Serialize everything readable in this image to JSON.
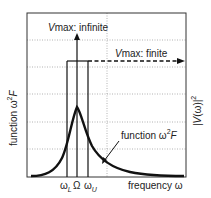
{
  "diagram": {
    "y_axis_left_label": {
      "prefix": "function ",
      "omega": "ω",
      "power": "2",
      "var": "F"
    },
    "y_axis_right_label": {
      "open": "|",
      "var": "V",
      "arg": "(ω)",
      "close": "|",
      "power": "2"
    },
    "x_axis_label": "frequency ω",
    "x_ticks": {
      "lower": {
        "symbol": "ω",
        "sub": "L"
      },
      "center": {
        "symbol": "Ω"
      },
      "upper": {
        "symbol": "ω",
        "sub": "U"
      }
    },
    "annotations": {
      "infinite": {
        "v": "V",
        "rest": "max: infinite"
      },
      "finite": {
        "v": "V",
        "rest": "max: finite"
      },
      "curve": {
        "prefix": "function ",
        "omega": "ω",
        "power": "2",
        "var": "F"
      }
    },
    "colors": {
      "line": "#111111",
      "grid": "#9a9a9a",
      "frame": "#333333"
    }
  }
}
